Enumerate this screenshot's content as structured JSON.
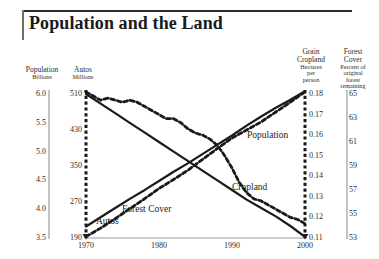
{
  "title": "Population and the Land",
  "axes_headers": {
    "population": {
      "name": "Population",
      "unit": "Billions"
    },
    "autos": {
      "name": "Autos",
      "unit": "Millions"
    },
    "cropland": {
      "name_line1": "Grain",
      "name_line2": "Cropland",
      "unit_line1": "Hectares",
      "unit_line2": "per",
      "unit_line3": "person"
    },
    "forest": {
      "name_line1": "Forest",
      "name_line2": "Cover",
      "unit_line1": "Percent of",
      "unit_line2": "original",
      "unit_line3": "forest",
      "unit_line4": "remaining"
    }
  },
  "chart_data": {
    "type": "line",
    "title": "Population and the Land",
    "xlabel": "",
    "ylabel": "",
    "grid": false,
    "legend": "inline-labels",
    "x": [
      1970,
      1975,
      1980,
      1985,
      1990,
      1995,
      2000
    ],
    "xlim": [
      1970,
      2000
    ],
    "xticks": [
      "1970",
      "1980",
      "1990",
      "2000"
    ],
    "xtick_values": [
      1970,
      1980,
      1990,
      2000
    ],
    "axes": [
      {
        "id": "population",
        "side": "left",
        "label": "Population",
        "unit": "Billions",
        "ticks": [
          "6.0",
          "5.5",
          "5.0",
          "4.5",
          "4.0",
          "3.5"
        ],
        "tick_values": [
          6.0,
          5.5,
          5.0,
          4.5,
          4.0,
          3.5
        ],
        "lim": [
          3.5,
          6.0
        ],
        "line_style": "solid-thin-gray"
      },
      {
        "id": "autos",
        "side": "left",
        "label": "Autos",
        "unit": "Millions",
        "ticks": [
          "510",
          "430",
          "350",
          "270",
          "190"
        ],
        "tick_values": [
          510,
          430,
          350,
          270,
          190
        ],
        "lim": [
          190,
          510
        ],
        "line_style": "dashed-thick-black"
      },
      {
        "id": "cropland",
        "side": "right",
        "label": "Grain Cropland",
        "unit": "Hectares per person",
        "ticks": [
          "0.18",
          "0.17",
          "0.16",
          "0.15",
          "0.14",
          "0.13",
          "0.12",
          "0.11"
        ],
        "tick_values": [
          0.18,
          0.17,
          0.16,
          0.15,
          0.14,
          0.13,
          0.12,
          0.11
        ],
        "lim": [
          0.11,
          0.18
        ],
        "line_style": "dashed-thick-black"
      },
      {
        "id": "forest",
        "side": "right",
        "label": "Forest Cover",
        "unit": "Percent of original forest remaining",
        "ticks": [
          "65",
          "63",
          "61",
          "59",
          "57",
          "55",
          "53"
        ],
        "tick_values": [
          65,
          63,
          61,
          59,
          57,
          55,
          53
        ],
        "lim": [
          53,
          65
        ],
        "line_style": "solid-thin-gray"
      }
    ],
    "series": [
      {
        "name": "Population",
        "axis": "population",
        "unit": "Billions",
        "style": "solid",
        "color": "#1a1a1a",
        "x": [
          1970,
          1972,
          1974,
          1976,
          1978,
          1980,
          1982,
          1984,
          1986,
          1988,
          1990,
          1992,
          1994,
          1996,
          1998,
          2000
        ],
        "values": [
          3.7,
          3.86,
          4.02,
          4.18,
          4.33,
          4.49,
          4.65,
          4.8,
          4.96,
          5.12,
          5.28,
          5.45,
          5.61,
          5.76,
          5.9,
          6.05
        ]
      },
      {
        "name": "Autos",
        "axis": "autos",
        "unit": "Millions",
        "style": "dashed",
        "color": "#1a1a1a",
        "x": [
          1970,
          1972,
          1974,
          1976,
          1978,
          1980,
          1982,
          1984,
          1986,
          1988,
          1990,
          1992,
          1994,
          1996,
          1998,
          2000
        ],
        "values": [
          193,
          212,
          233,
          255,
          277,
          300,
          320,
          341,
          365,
          389,
          412,
          430,
          448,
          470,
          492,
          515
        ]
      },
      {
        "name": "Cropland",
        "axis": "cropland",
        "unit": "Hectares per person",
        "style": "dashed",
        "color": "#1a1a1a",
        "x": [
          1970,
          1971,
          1972,
          1973,
          1974,
          1975,
          1976,
          1977,
          1978,
          1979,
          1980,
          1981,
          1982,
          1983,
          1984,
          1985,
          1986,
          1987,
          1988,
          1989,
          1990,
          1991,
          1992,
          1993,
          1994,
          1995,
          1996,
          1997,
          1998,
          1999,
          2000
        ],
        "values": [
          0.181,
          0.179,
          0.177,
          0.178,
          0.177,
          0.176,
          0.177,
          0.176,
          0.174,
          0.172,
          0.17,
          0.168,
          0.168,
          0.166,
          0.163,
          0.161,
          0.16,
          0.158,
          0.155,
          0.15,
          0.144,
          0.137,
          0.132,
          0.129,
          0.128,
          0.126,
          0.124,
          0.122,
          0.12,
          0.119,
          0.117
        ]
      },
      {
        "name": "Forest Cover",
        "axis": "forest",
        "unit": "Percent of original forest remaining",
        "style": "solid",
        "color": "#1a1a1a",
        "x": [
          1970,
          1972,
          1974,
          1976,
          1978,
          1980,
          1982,
          1984,
          1986,
          1988,
          1990,
          1992,
          1994,
          1996,
          1998,
          2000
        ],
        "values": [
          65.0,
          64.2,
          63.4,
          62.6,
          61.8,
          61.0,
          60.2,
          59.4,
          58.6,
          57.8,
          57.0,
          56.2,
          55.5,
          54.8,
          54.0,
          53.1
        ]
      }
    ],
    "annotations": [
      {
        "text": "Population",
        "x": 1992,
        "series": "Population"
      },
      {
        "text": "Autos",
        "x": 1973,
        "series": "Autos"
      },
      {
        "text": "Cropland",
        "x": 1993,
        "series": "Cropland"
      },
      {
        "text": "Forest Cover",
        "x": 1981,
        "series": "Forest Cover"
      }
    ]
  }
}
